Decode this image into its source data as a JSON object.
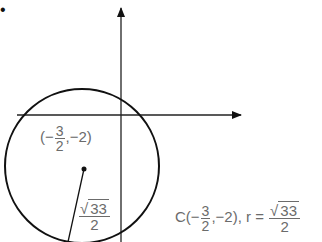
{
  "figure": {
    "bullet": "•",
    "center_label": {
      "open": "(−",
      "frac_num": "3",
      "frac_den": "2",
      "rest": ",−2)"
    },
    "radius_label": {
      "root_sign": "√",
      "radicand": "33",
      "den": "2"
    },
    "caption": {
      "prefix": "C(−",
      "frac_num": "3",
      "frac_den": "2",
      "mid": ",−2), r =",
      "root_sign": "√",
      "radicand": "33",
      "den": "2"
    },
    "colors": {
      "stroke": "#111111",
      "text": "#6b6b6b"
    }
  }
}
